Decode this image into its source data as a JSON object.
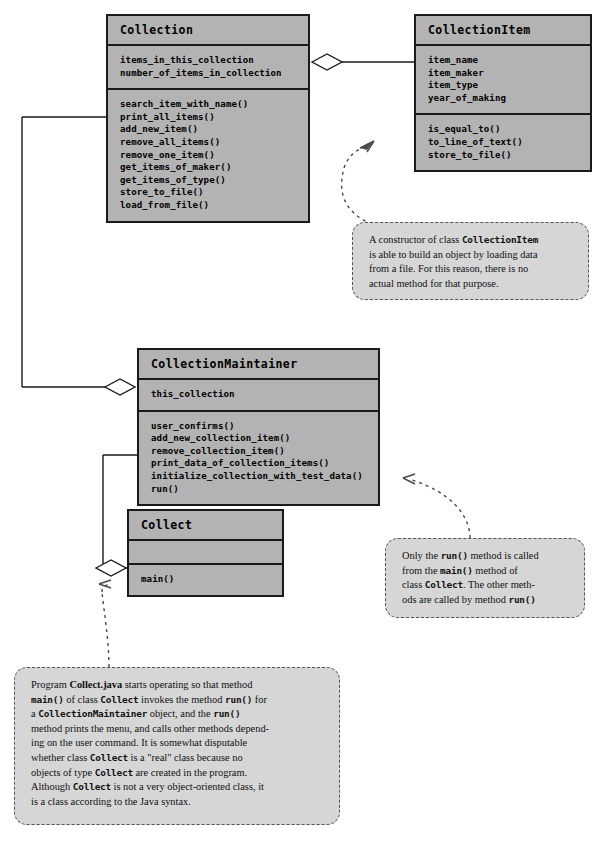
{
  "diagram": {
    "colors": {
      "class_fill": "#b3b3b3",
      "class_border": "#1a1a1a",
      "note_fill": "#d6d6d6",
      "note_border": "#555555",
      "page_background": "#ffffff"
    }
  },
  "classes": [
    {
      "id": "collection",
      "name": "Collection",
      "attributes": [
        "items_in_this_collection",
        "number_of_items_in_collection"
      ],
      "methods": [
        "search_item_with_name()",
        "print_all_items()",
        "add_new_item()",
        "remove_all_items()",
        "remove_one_item()",
        "get_items_of_maker()",
        "get_items_of_type()",
        "store_to_file()",
        "load_from_file()"
      ]
    },
    {
      "id": "collection_item",
      "name": "CollectionItem",
      "attributes": [
        "item_name",
        "item_maker",
        "item_type",
        "year_of_making"
      ],
      "methods": [
        "is_equal_to()",
        "to_line_of_text()",
        "store_to_file()"
      ]
    },
    {
      "id": "collection_maintainer",
      "name": "CollectionMaintainer",
      "attributes": [
        "this_collection"
      ],
      "methods": [
        "user_confirms()",
        "add_new_collection_item()",
        "remove_collection_item()",
        "print_data_of_collection_items()",
        "initialize_collection_with_test_data()",
        "run()"
      ]
    },
    {
      "id": "collect",
      "name": "Collect",
      "attributes": [],
      "methods": [
        "main()"
      ]
    }
  ],
  "relationships": [
    {
      "type": "aggregation",
      "from": "Collection",
      "to": "CollectionItem",
      "diamond_end": "Collection"
    },
    {
      "type": "aggregation",
      "from": "CollectionMaintainer",
      "to": "Collection",
      "diamond_end": "CollectionMaintainer"
    },
    {
      "type": "aggregation",
      "from": "Collect",
      "to": "CollectionMaintainer",
      "diamond_end": "Collect"
    }
  ],
  "notes": [
    {
      "id": "note_item",
      "target": "CollectionItem",
      "lines": [
        {
          "segments": [
            {
              "text": "A constructor of class ",
              "style": "plain"
            },
            {
              "text": "CollectionItem",
              "style": "code"
            }
          ]
        },
        {
          "segments": [
            {
              "text": "is able to build an object by loading data",
              "style": "plain"
            }
          ]
        },
        {
          "segments": [
            {
              "text": "from a file. For this reason, there is no",
              "style": "plain"
            }
          ]
        },
        {
          "segments": [
            {
              "text": "actual method for that purpose.",
              "style": "plain"
            }
          ]
        }
      ]
    },
    {
      "id": "note_run",
      "target": "CollectionMaintainer",
      "lines": [
        {
          "segments": [
            {
              "text": "Only the ",
              "style": "plain"
            },
            {
              "text": "run()",
              "style": "code"
            },
            {
              "text": " method is called",
              "style": "plain"
            }
          ]
        },
        {
          "segments": [
            {
              "text": "from the ",
              "style": "plain"
            },
            {
              "text": "main()",
              "style": "code"
            },
            {
              "text": " method of",
              "style": "plain"
            }
          ]
        },
        {
          "segments": [
            {
              "text": "class ",
              "style": "plain"
            },
            {
              "text": "Collect",
              "style": "code"
            },
            {
              "text": ". The other meth-",
              "style": "plain"
            }
          ]
        },
        {
          "segments": [
            {
              "text": "ods are called by method ",
              "style": "plain"
            },
            {
              "text": "run()",
              "style": "code"
            }
          ]
        }
      ]
    },
    {
      "id": "note_program",
      "target": "Collect",
      "lines": [
        {
          "segments": [
            {
              "text": "Program ",
              "style": "plain"
            },
            {
              "text": "Collect.java",
              "style": "bold"
            },
            {
              "text": " starts operating so that method",
              "style": "plain"
            }
          ]
        },
        {
          "segments": [
            {
              "text": "main()",
              "style": "code"
            },
            {
              "text": " of class ",
              "style": "plain"
            },
            {
              "text": "Collect",
              "style": "code"
            },
            {
              "text": " invokes the method ",
              "style": "plain"
            },
            {
              "text": "run()",
              "style": "code"
            },
            {
              "text": " for",
              "style": "plain"
            }
          ]
        },
        {
          "segments": [
            {
              "text": "a ",
              "style": "plain"
            },
            {
              "text": "CollectionMaintainer",
              "style": "code"
            },
            {
              "text": " object, and the ",
              "style": "plain"
            },
            {
              "text": "run()",
              "style": "code"
            }
          ]
        },
        {
          "segments": [
            {
              "text": "method prints the menu, and calls other methods depend-",
              "style": "plain"
            }
          ]
        },
        {
          "segments": [
            {
              "text": "ing on the user command. It is somewhat disputable",
              "style": "plain"
            }
          ]
        },
        {
          "segments": [
            {
              "text": "whether class ",
              "style": "plain"
            },
            {
              "text": "Collect",
              "style": "code"
            },
            {
              "text": " is a \"real\" class because no",
              "style": "plain"
            }
          ]
        },
        {
          "segments": [
            {
              "text": "objects of type ",
              "style": "plain"
            },
            {
              "text": "Collect",
              "style": "code"
            },
            {
              "text": " are created in the program.",
              "style": "plain"
            }
          ]
        },
        {
          "segments": [
            {
              "text": "Although ",
              "style": "plain"
            },
            {
              "text": "Collect",
              "style": "code"
            },
            {
              "text": " is not a very object-oriented class, it",
              "style": "plain"
            }
          ]
        },
        {
          "segments": [
            {
              "text": "is a class according to the Java syntax.",
              "style": "plain"
            }
          ]
        }
      ]
    }
  ]
}
